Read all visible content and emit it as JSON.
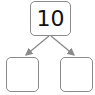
{
  "diagram": {
    "type": "number-bond",
    "whole": "10",
    "parts": [
      "",
      ""
    ],
    "colors": {
      "border": "#8a8a8a",
      "arrow": "#8a8a8a",
      "text": "#111111"
    }
  }
}
